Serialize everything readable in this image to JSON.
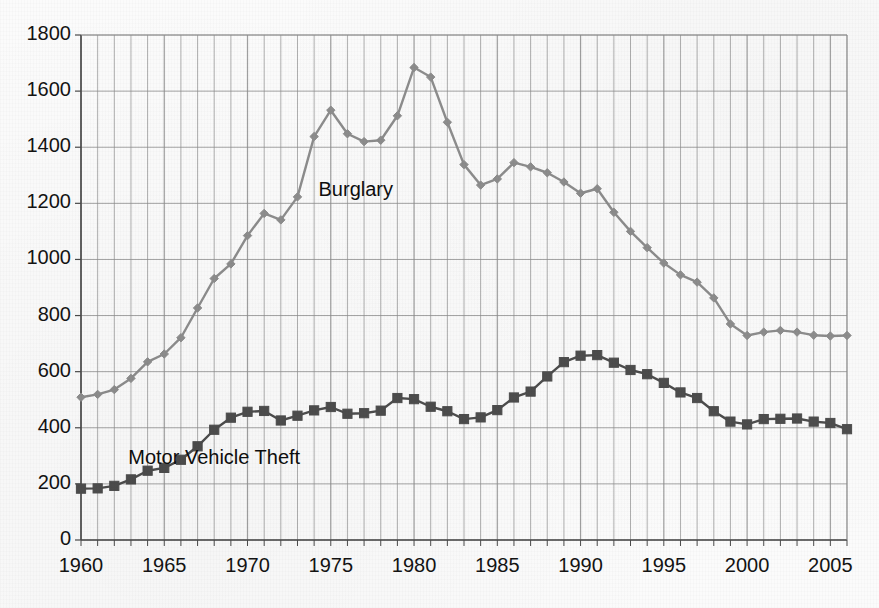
{
  "chart_data": {
    "type": "line",
    "title": "",
    "subtitle": "",
    "xlabel": "",
    "ylabel": "",
    "xlim": [
      1960,
      2006
    ],
    "ylim": [
      0,
      1800
    ],
    "grid": true,
    "legend_position": "inline-annotation",
    "y_ticks": [
      0,
      200,
      400,
      600,
      800,
      1000,
      1200,
      1400,
      1600,
      1800
    ],
    "y_tick_labels": [
      "0",
      "200",
      "400",
      "600",
      "800",
      "1000",
      "1200",
      "1400",
      "1600",
      "1800"
    ],
    "x_ticks": [
      1960,
      1965,
      1970,
      1975,
      1980,
      1985,
      1990,
      1995,
      2000,
      2005
    ],
    "x_tick_labels": [
      "1960",
      "1965",
      "1970",
      "1975",
      "1980",
      "1985",
      "1990",
      "1995",
      "2000",
      "2005"
    ],
    "x": [
      1960,
      1961,
      1962,
      1963,
      1964,
      1965,
      1966,
      1967,
      1968,
      1969,
      1970,
      1971,
      1972,
      1973,
      1974,
      1975,
      1976,
      1977,
      1978,
      1979,
      1980,
      1981,
      1982,
      1983,
      1984,
      1985,
      1986,
      1987,
      1988,
      1989,
      1990,
      1991,
      1992,
      1993,
      1994,
      1995,
      1996,
      1997,
      1998,
      1999,
      2000,
      2001,
      2002,
      2003,
      2004,
      2005,
      2006
    ],
    "series": [
      {
        "name": "Burglary",
        "marker": "diamond",
        "color": "#8d8d8d",
        "values": [
          509,
          519,
          536,
          576,
          635,
          663,
          721,
          827,
          932,
          984,
          1085,
          1164,
          1141,
          1223,
          1438,
          1532,
          1448,
          1420,
          1425,
          1512,
          1684,
          1650,
          1489,
          1338,
          1265,
          1287,
          1345,
          1330,
          1309,
          1276,
          1236,
          1252,
          1168,
          1100,
          1042,
          987,
          945,
          919,
          863,
          770,
          729,
          741,
          747,
          741,
          730,
          727,
          729
        ]
      },
      {
        "name": "Motor Vehicle Theft",
        "marker": "square",
        "color": "#4d4d4d",
        "values": [
          183,
          184,
          193,
          216,
          247,
          257,
          286,
          334,
          393,
          436,
          457,
          460,
          426,
          443,
          462,
          474,
          450,
          452,
          461,
          506,
          502,
          475,
          459,
          431,
          437,
          463,
          508,
          529,
          583,
          634,
          657,
          659,
          632,
          606,
          591,
          560,
          526,
          506,
          459,
          422,
          412,
          431,
          432,
          433,
          422,
          417,
          395
        ]
      }
    ],
    "annotations": [
      {
        "text": "Burglary",
        "x": 1976.5,
        "y": 1245
      },
      {
        "text": "Motor Vehicle Theft",
        "x": 1968.0,
        "y": 290
      }
    ]
  },
  "layout": {
    "plot_left": 81,
    "plot_right": 847,
    "plot_top": 35,
    "plot_bottom": 540,
    "grid_color": "#8e8e8e",
    "axis_color": "#4a4a4a",
    "background_color": "#fbfbfb"
  }
}
